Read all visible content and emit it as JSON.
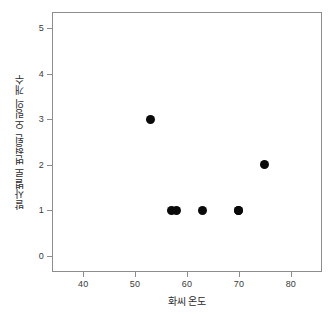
{
  "chart_data": {
    "type": "scatter",
    "title": "",
    "xlabel": "화씨 온도",
    "ylabel": "발사별로 변형된 오링의 개수",
    "xlim": [
      34,
      86
    ],
    "ylim": [
      -0.35,
      5.35
    ],
    "xticks": [
      40,
      50,
      60,
      70,
      80
    ],
    "xtick_labels": [
      "40",
      "50",
      "60",
      "70",
      "80"
    ],
    "yticks": [
      0,
      1,
      2,
      3,
      4,
      5
    ],
    "ytick_labels": [
      "0",
      "1",
      "2",
      "3",
      "4",
      "5"
    ],
    "grid": false,
    "legend": false,
    "marker": "filled-circle",
    "marker_color": "#0a0a0a",
    "frame_color": "#8d8d8d",
    "background_color": "#ffffff",
    "points": [
      {
        "x": 53,
        "y": 3
      },
      {
        "x": 57,
        "y": 1
      },
      {
        "x": 58,
        "y": 1
      },
      {
        "x": 63,
        "y": 1
      },
      {
        "x": 70,
        "y": 1
      },
      {
        "x": 70,
        "y": 1
      },
      {
        "x": 75,
        "y": 2
      }
    ],
    "x": [
      53,
      57,
      58,
      63,
      70,
      70,
      75
    ],
    "values": [
      3,
      1,
      1,
      1,
      1,
      1,
      2
    ]
  }
}
